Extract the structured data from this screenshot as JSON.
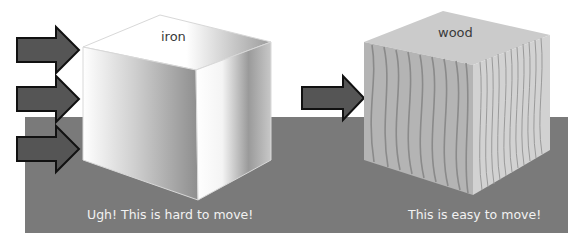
{
  "scene": {
    "floor_color": "#7a7a7a",
    "arrow_fill": "#555555",
    "arrow_stroke": "#111111"
  },
  "iron": {
    "label": "iron",
    "caption": "Ugh! This is hard to move!",
    "arrow_count": 3
  },
  "wood": {
    "label": "wood",
    "caption": "This is easy to move!",
    "arrow_count": 1,
    "color": "#c8c8c8",
    "grain_color": "#8a8a8a"
  }
}
